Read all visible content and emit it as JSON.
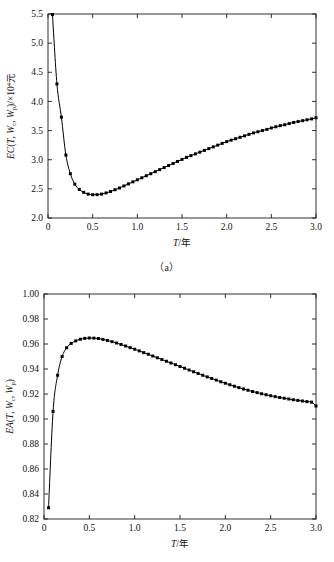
{
  "figure": {
    "panels": [
      {
        "id": "a",
        "caption": "（a）",
        "xlabel": "T/年",
        "ylabel_parts": {
          "prefix": "EC",
          "open": "(",
          "v1": "T",
          "sep1": ",  ",
          "v2": "W",
          "sub2": "c",
          "sep2": ",  ",
          "v3": "W",
          "sub3": "p",
          "close": ")",
          "suffix": "/×10",
          "exp": "4",
          "unit": "元"
        },
        "ylabel_plain": "EC(T, Wc, Wp)/×10⁴元"
      },
      {
        "id": "b",
        "caption": "（b）",
        "xlabel": "T/年",
        "ylabel_parts": {
          "prefix": "EA",
          "open": "(",
          "v1": "T",
          "sep1": ",  ",
          "v2": "W",
          "sub2": "c",
          "sep2": ",  ",
          "v3": "W",
          "sub3": "p",
          "close": ")",
          "suffix": "",
          "exp": "",
          "unit": ""
        },
        "ylabel_plain": "EA(T, Wc, Wp)"
      }
    ]
  },
  "chart_data": [
    {
      "type": "line",
      "panel": "a",
      "title": "",
      "xlabel": "T/年",
      "ylabel": "EC(T, Wc, Wp)/×10⁴元",
      "xlim": [
        0,
        3.0
      ],
      "ylim": [
        2.0,
        5.5
      ],
      "xticks": [
        0,
        0.5,
        1.0,
        1.5,
        2.0,
        2.5,
        3.0
      ],
      "xticklabels": [
        "0",
        "0.5",
        "1.0",
        "1.5",
        "2.0",
        "2.5",
        "3.0"
      ],
      "yticks": [
        2.0,
        2.5,
        3.0,
        3.5,
        4.0,
        4.5,
        5.0,
        5.5
      ],
      "yticklabels": [
        "2.0",
        "2.5",
        "3.0",
        "3.5",
        "4.0",
        "4.5",
        "5.0",
        "5.5"
      ],
      "grid": false,
      "legend": "none",
      "marker": "square",
      "series": [
        {
          "name": "EC",
          "x": [
            0.05,
            0.1,
            0.15,
            0.2,
            0.25,
            0.3,
            0.35,
            0.4,
            0.45,
            0.5,
            0.55,
            0.6,
            0.65,
            0.7,
            0.75,
            0.8,
            0.85,
            0.9,
            0.95,
            1.0,
            1.05,
            1.1,
            1.15,
            1.2,
            1.25,
            1.3,
            1.35,
            1.4,
            1.45,
            1.5,
            1.55,
            1.6,
            1.65,
            1.7,
            1.75,
            1.8,
            1.85,
            1.9,
            1.95,
            2.0,
            2.05,
            2.1,
            2.15,
            2.2,
            2.25,
            2.3,
            2.35,
            2.4,
            2.45,
            2.5,
            2.55,
            2.6,
            2.65,
            2.7,
            2.75,
            2.8,
            2.85,
            2.9,
            2.95,
            3.0
          ],
          "y": [
            5.49,
            4.3,
            3.73,
            3.08,
            2.76,
            2.58,
            2.49,
            2.44,
            2.41,
            2.4,
            2.401,
            2.41,
            2.43,
            2.455,
            2.485,
            2.515,
            2.55,
            2.585,
            2.62,
            2.655,
            2.69,
            2.725,
            2.76,
            2.795,
            2.83,
            2.865,
            2.9,
            2.935,
            2.97,
            3.005,
            3.04,
            3.07,
            3.1,
            3.13,
            3.16,
            3.19,
            3.22,
            3.25,
            3.28,
            3.31,
            3.335,
            3.36,
            3.385,
            3.41,
            3.435,
            3.46,
            3.48,
            3.5,
            3.52,
            3.545,
            3.565,
            3.585,
            3.6,
            3.62,
            3.64,
            3.655,
            3.67,
            3.685,
            3.7,
            3.72
          ]
        }
      ]
    },
    {
      "type": "line",
      "panel": "b",
      "title": "",
      "xlabel": "T/年",
      "ylabel": "EA(T, Wc, Wp)",
      "xlim": [
        0,
        3.0
      ],
      "ylim": [
        0.82,
        1.0
      ],
      "xticks": [
        0,
        0.5,
        1.0,
        1.5,
        2.0,
        2.5,
        3.0
      ],
      "xticklabels": [
        "0",
        "0.5",
        "1.0",
        "1.5",
        "2.0",
        "2.5",
        "3.0"
      ],
      "yticks": [
        0.82,
        0.84,
        0.86,
        0.88,
        0.9,
        0.92,
        0.94,
        0.96,
        0.98,
        1.0
      ],
      "yticklabels": [
        "0.82",
        "0.84",
        "0.86",
        "0.88",
        "0.90",
        "0.92",
        "0.94",
        "0.96",
        "0.98",
        "1.00"
      ],
      "grid": false,
      "legend": "none",
      "marker": "square",
      "series": [
        {
          "name": "EA",
          "x": [
            0.05,
            0.1,
            0.15,
            0.2,
            0.25,
            0.3,
            0.35,
            0.4,
            0.45,
            0.5,
            0.55,
            0.6,
            0.65,
            0.7,
            0.75,
            0.8,
            0.85,
            0.9,
            0.95,
            1.0,
            1.05,
            1.1,
            1.15,
            1.2,
            1.25,
            1.3,
            1.35,
            1.4,
            1.45,
            1.5,
            1.55,
            1.6,
            1.65,
            1.7,
            1.75,
            1.8,
            1.85,
            1.9,
            1.95,
            2.0,
            2.05,
            2.1,
            2.15,
            2.2,
            2.25,
            2.3,
            2.35,
            2.4,
            2.45,
            2.5,
            2.55,
            2.6,
            2.65,
            2.7,
            2.75,
            2.8,
            2.85,
            2.9,
            2.95,
            3.0
          ],
          "y": [
            0.829,
            0.906,
            0.935,
            0.95,
            0.957,
            0.9605,
            0.9625,
            0.9638,
            0.9645,
            0.9648,
            0.9647,
            0.9644,
            0.9637,
            0.9628,
            0.9619,
            0.9608,
            0.9596,
            0.9584,
            0.9571,
            0.9558,
            0.9545,
            0.9531,
            0.9518,
            0.9504,
            0.949,
            0.9476,
            0.9462,
            0.9448,
            0.9434,
            0.942,
            0.9406,
            0.9392,
            0.9378,
            0.9364,
            0.935,
            0.9337,
            0.9324,
            0.9311,
            0.9298,
            0.9286,
            0.9274,
            0.9262,
            0.9251,
            0.924,
            0.923,
            0.922,
            0.9211,
            0.9202,
            0.9194,
            0.9186,
            0.9179,
            0.9172,
            0.9166,
            0.916,
            0.9154,
            0.9149,
            0.9144,
            0.9139,
            0.9135,
            0.9104
          ]
        }
      ]
    }
  ]
}
